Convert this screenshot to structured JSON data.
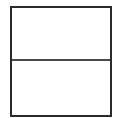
{
  "diagram": {
    "shape": "rectangle",
    "sections": [
      {
        "name": "top-section",
        "label": ""
      },
      {
        "name": "bottom-section",
        "label": ""
      }
    ],
    "colors": {
      "border": "#2b2b2b",
      "divider": "#4a4a4a",
      "background": "#ffffff"
    }
  }
}
